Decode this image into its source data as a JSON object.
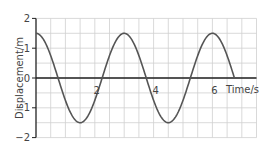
{
  "chart_data": {
    "type": "line",
    "title": "",
    "xlabel": "Time/s",
    "ylabel": "Displacement/m",
    "xlim": [
      0,
      7.5
    ],
    "ylim": [
      -2,
      2
    ],
    "grid": true,
    "grid_step_x": 0.5,
    "grid_step_y": 0.5,
    "x_ticks": [
      2,
      4,
      6
    ],
    "x_tick_labels": [
      "2",
      "4",
      "6"
    ],
    "y_ticks": [
      2,
      1,
      0,
      -1,
      -2
    ],
    "y_tick_labels": [
      "2",
      "1",
      "0",
      "−1",
      "−2"
    ],
    "legend": null,
    "series": [
      {
        "name": "displacement",
        "function": "1.5*cos(2*pi*t/3)",
        "amplitude": 1.5,
        "period": 3,
        "t_start": 0,
        "t_end": 6.75,
        "x": [
          0,
          0.75,
          1.5,
          2.25,
          3,
          3.75,
          4.5,
          5.25,
          6,
          6.75
        ],
        "values": [
          1.5,
          0,
          -1.5,
          0,
          1.5,
          0,
          -1.5,
          0,
          1.5,
          0
        ]
      }
    ]
  },
  "colors": {
    "grid": "#cfcfcf",
    "axis": "#222222",
    "curve": "#555555",
    "text": "#444444"
  }
}
